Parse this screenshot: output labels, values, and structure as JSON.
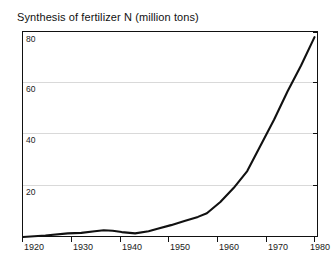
{
  "chart_data": {
    "type": "line",
    "title": "Synthesis of fertilizer N  (million tons)",
    "xlabel": "",
    "ylabel": "",
    "xlim": [
      1920,
      1986
    ],
    "ylim": [
      0,
      80
    ],
    "grid": true,
    "legend": false,
    "legend_position": "none",
    "line_color": "#111111",
    "grid_color": "#d9d9d9",
    "axis_color": "#111111",
    "xticks": [
      1920,
      1930,
      1940,
      1950,
      1960,
      1970,
      1980
    ],
    "xtick_labels": [
      "1920",
      "1930",
      "1940",
      "1950",
      "1960",
      "1970",
      "1980"
    ],
    "yticks": [
      20,
      40,
      60,
      80
    ],
    "ytick_labels": [
      "20",
      "40",
      "60",
      "80"
    ],
    "series": [
      {
        "name": "Synthesis of fertilizer N",
        "x": [
          1920,
          1925,
          1930,
          1933,
          1936,
          1938,
          1940,
          1942,
          1945,
          1948,
          1950,
          1953,
          1956,
          1959,
          1961,
          1964,
          1967,
          1970,
          1973,
          1976,
          1979,
          1982,
          1985
        ],
        "values": [
          0.4,
          1.0,
          1.8,
          2.0,
          2.6,
          3.0,
          2.8,
          2.3,
          1.8,
          2.6,
          3.6,
          5.0,
          6.6,
          8.2,
          9.6,
          14.0,
          19.5,
          26.0,
          36.0,
          46.0,
          57.0,
          67.0,
          78.0
        ]
      }
    ]
  }
}
